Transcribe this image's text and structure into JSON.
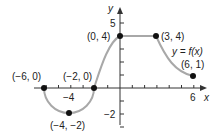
{
  "chart_data": {
    "type": "line",
    "title": "",
    "xlabel": "x",
    "ylabel": "y",
    "function_label": "y = f(x)",
    "xlim": [
      -6,
      6
    ],
    "ylim": [
      -3,
      5
    ],
    "x_ticks": [
      -6,
      -5,
      -4,
      -3,
      -2,
      -1,
      1,
      2,
      3,
      4,
      5,
      6
    ],
    "y_ticks": [
      -3,
      -2,
      -1,
      1,
      2,
      3,
      4,
      5
    ],
    "x_tick_labels": [
      {
        "value": -4,
        "label": "−4"
      },
      {
        "value": 6,
        "label": "6"
      }
    ],
    "y_tick_labels": [
      {
        "value": 5,
        "label": "5"
      },
      {
        "value": -2,
        "label": "−2"
      }
    ],
    "grid": false,
    "series": [
      {
        "name": "y = f(x)",
        "segments": [
          {
            "shape": "semicircle-down",
            "from": [
              -6,
              0
            ],
            "through": [
              -4,
              -2
            ],
            "to": [
              -2,
              0
            ]
          },
          {
            "shape": "curve-concave-down",
            "from": [
              -2,
              0
            ],
            "to": [
              0,
              4
            ]
          },
          {
            "shape": "horizontal-line",
            "from": [
              0,
              4
            ],
            "to": [
              3,
              4
            ]
          },
          {
            "shape": "curve-concave-up",
            "from": [
              3,
              4
            ],
            "to": [
              6,
              1
            ]
          }
        ]
      }
    ],
    "points": [
      {
        "x": -6,
        "y": 0,
        "label": "(−6, 0)"
      },
      {
        "x": -4,
        "y": -2,
        "label": "(−4, −2)"
      },
      {
        "x": -2,
        "y": 0,
        "label": "(−2, 0)"
      },
      {
        "x": 0,
        "y": 4,
        "label": "(0, 4)"
      },
      {
        "x": 3,
        "y": 4,
        "label": "(3, 4)"
      },
      {
        "x": 6,
        "y": 1,
        "label": "(6, 1)"
      }
    ],
    "colors": {
      "curve": "#a8a8a8",
      "axes": "#333333",
      "points": "#111111"
    }
  }
}
